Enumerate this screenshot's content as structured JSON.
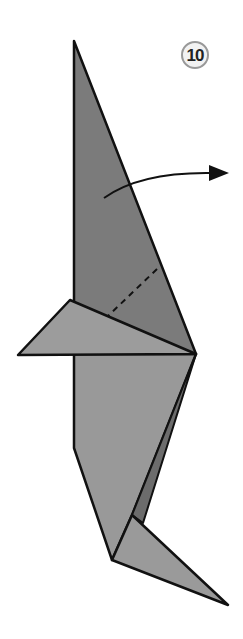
{
  "diagram": {
    "type": "origami-step",
    "step_number": "10",
    "instruction": "valley fold along dashed line, flap swings to the right",
    "colors": {
      "background": "#ffffff",
      "outline": "#111111",
      "upper_body": "#7b7b7b",
      "wing": "#9c9c9c",
      "lower_body": "#999999",
      "inner_fold": "#6c6c6c",
      "foot": "#9a9a9a",
      "badge_fill": "#f2f2f2",
      "badge_stroke": "#999999"
    },
    "symbols": [
      "step-number-badge",
      "curved-fold-arrow",
      "dashed-valley-fold-line"
    ]
  }
}
